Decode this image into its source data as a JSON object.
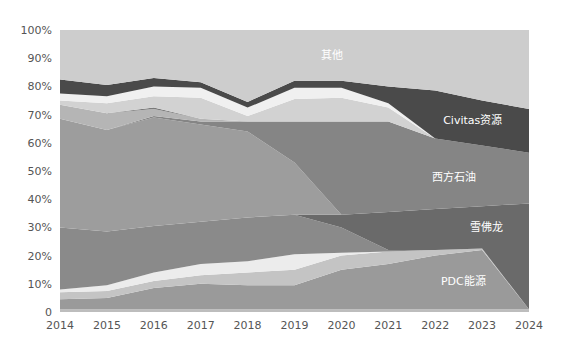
{
  "chart_data": {
    "type": "area",
    "stacked": true,
    "normalized": true,
    "title": "",
    "xlabel": "",
    "ylabel": "",
    "x": [
      2014,
      2015,
      2016,
      2017,
      2018,
      2019,
      2020,
      2021,
      2022,
      2023,
      2024
    ],
    "y_ticks": [
      "0",
      "10%",
      "20%",
      "30%",
      "40%",
      "50%",
      "60%",
      "70%",
      "80%",
      "90%",
      "100%"
    ],
    "ylim": [
      0,
      100
    ],
    "grid": false,
    "legend": "inline labels",
    "boundaries_note": "cumulative top of each layer, percent of total, bottom to top",
    "series": [
      {
        "name": "bottom-sliver",
        "label": "",
        "color": "#bdbdbd",
        "top": [
          1,
          1,
          1,
          1,
          1,
          1,
          1,
          1,
          1,
          1,
          1
        ]
      },
      {
        "name": "PDC能源",
        "label": "PDC能源",
        "color": "#9a9a9a",
        "top": [
          4.5,
          5,
          8.5,
          10,
          9.5,
          9.5,
          15,
          17,
          20,
          22,
          1
        ]
      },
      {
        "name": "layer-light-a",
        "label": "",
        "color": "#c4c4c4",
        "top": [
          7,
          7.5,
          11,
          13,
          14,
          15,
          20,
          21.5,
          22,
          22.5,
          1
        ]
      },
      {
        "name": "layer-white-a",
        "label": "",
        "color": "#ececec",
        "top": [
          8,
          9.5,
          14,
          17,
          18,
          20.5,
          21,
          21.5,
          22,
          22.5,
          1
        ]
      },
      {
        "name": "layer-mid-a",
        "label": "",
        "color": "#8a8a8a",
        "top": [
          30,
          28.5,
          30.5,
          32,
          33.5,
          34.5,
          30,
          22,
          22,
          22.5,
          1
        ]
      },
      {
        "name": "雪佛龙",
        "label": "雪佛龙",
        "color": "#6a6a6a",
        "top": [
          30,
          28.5,
          30.5,
          32,
          33.5,
          34.5,
          34.5,
          35.5,
          36.5,
          37.5,
          38.5
        ]
      },
      {
        "name": "layer-mid-b",
        "label": "",
        "color": "#9d9d9d",
        "top": [
          68.5,
          64.5,
          69,
          66.5,
          64,
          53,
          34.5,
          35.5,
          36.5,
          37.5,
          38.5
        ]
      },
      {
        "name": "西方石油",
        "label": "西方石油",
        "color": "#858585",
        "top": [
          68.5,
          64.5,
          69.5,
          67.5,
          67.5,
          67.5,
          67.5,
          67.5,
          61.5,
          59,
          56.5
        ]
      },
      {
        "name": "layer-light-b",
        "label": "",
        "color": "#b5b5b5",
        "top": [
          73.5,
          70.5,
          72,
          68.5,
          67.5,
          67.5,
          67.5,
          67.5,
          61.5,
          59,
          56.5
        ]
      },
      {
        "name": "layer-dark-sliver",
        "label": "",
        "color": "#7a7a7a",
        "top": [
          73.5,
          70.5,
          72.5,
          68.5,
          67.5,
          67.5,
          67.5,
          67.5,
          61.5,
          59,
          56.5
        ]
      },
      {
        "name": "layer-light-c",
        "label": "",
        "color": "#d2d2d2",
        "top": [
          75,
          74,
          76.5,
          76,
          69.5,
          75.5,
          76,
          72.5,
          61.5,
          59,
          56.5
        ]
      },
      {
        "name": "layer-white-b",
        "label": "",
        "color": "#f0f0f0",
        "top": [
          77.5,
          76.5,
          80,
          79.5,
          72.5,
          79.5,
          79.5,
          74,
          61.5,
          59,
          56.5
        ]
      },
      {
        "name": "Civitas资源",
        "label": "Civitas资源",
        "color": "#4a4a4a",
        "top": [
          82.5,
          80.5,
          83,
          81.5,
          74.5,
          82,
          82,
          80,
          78.5,
          75,
          72
        ]
      },
      {
        "name": "其他",
        "label": "其他",
        "color": "#cdcdcd",
        "top": [
          100,
          100,
          100,
          100,
          100,
          100,
          100,
          100,
          100,
          100,
          100
        ]
      }
    ],
    "annotations": [
      {
        "text": "其他",
        "x": 2019.8,
        "y": 91
      },
      {
        "text": "Civitas资源",
        "x": 2022.8,
        "y": 68
      },
      {
        "text": "西方石油",
        "x": 2022.4,
        "y": 48
      },
      {
        "text": "雪佛龙",
        "x": 2023.1,
        "y": 30
      },
      {
        "text": "PDC能源",
        "x": 2022.6,
        "y": 11
      }
    ]
  }
}
